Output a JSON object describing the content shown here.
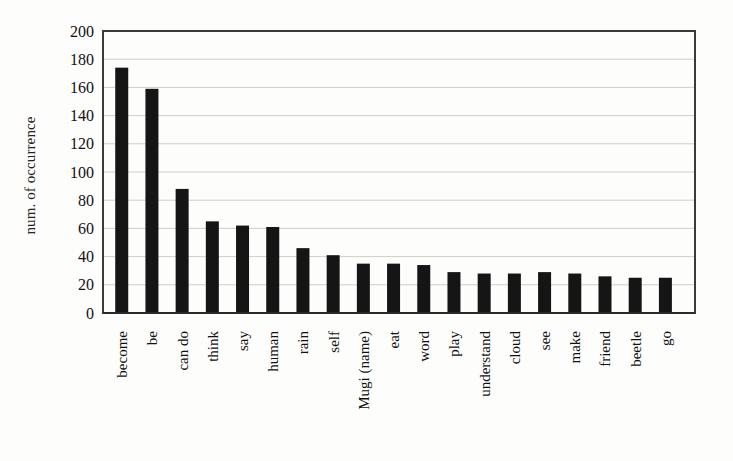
{
  "chart_data": {
    "type": "bar",
    "title": "",
    "xlabel": "",
    "ylabel": "num. of occurrence",
    "ylim": [
      0,
      200
    ],
    "ytick_step": 20,
    "yticks": [
      200,
      180,
      160,
      140,
      120,
      100,
      80,
      60,
      40,
      20,
      0
    ],
    "grid": true,
    "legend": "none",
    "bar_color": "#151515",
    "grid_color": "#c9c9c2",
    "frame_color": "#3a3a3a",
    "background_color": "#fdfdfb",
    "categories": [
      "become",
      "be",
      "can do",
      "think",
      "say",
      "human",
      "rain",
      "self",
      "Mugi (name)",
      "eat",
      "word",
      "play",
      "understand",
      "cloud",
      "see",
      "make",
      "friend",
      "beetle",
      "go"
    ],
    "values": [
      174,
      159,
      88,
      65,
      62,
      61,
      46,
      41,
      35,
      35,
      34,
      29,
      28,
      28,
      29,
      28,
      26,
      25,
      25
    ]
  }
}
